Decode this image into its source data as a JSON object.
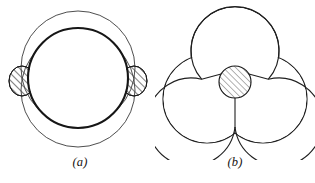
{
  "figure": {
    "background_color": "#ffffff",
    "stroke_color": "#1a1a1a",
    "thin_stroke_color": "#3a3a3a",
    "hatch_color": "#555555",
    "panels": [
      {
        "id": "a",
        "label": "(a)",
        "description": "Two overlapping spheres with a hatched lens-shaped contact ring",
        "thick_circle": {
          "cx": 78,
          "cy": 78,
          "r": 50,
          "stroke_width": 2.1
        },
        "thin_circle_top": {
          "cx": 78,
          "cy": 68,
          "r": 57,
          "stroke_width": 0.9
        },
        "thin_circle_bottom": {
          "cx": 78,
          "cy": 90,
          "r": 57,
          "stroke_width": 0.9
        },
        "hatched_ellipse_left": {
          "cx": 22,
          "cy": 81,
          "rx": 13,
          "ry": 15
        },
        "hatched_ellipse_right": {
          "cx": 134,
          "cy": 81,
          "rx": 13,
          "ry": 15
        }
      },
      {
        "id": "b",
        "label": "(b)",
        "description": "Three spheres meeting at a hatched central circle with three radial partitions",
        "lobe_radius": 44,
        "lobes": [
          {
            "name": "top-lobe",
            "cx": 80,
            "cy": 51
          },
          {
            "name": "bottom-left-lobe",
            "cx": 52,
            "cy": 99
          },
          {
            "name": "bottom-right-lobe",
            "cx": 108,
            "cy": 99
          }
        ],
        "center_circle": {
          "cx": 80,
          "cy": 82,
          "r": 16
        },
        "radial_lines": [
          {
            "name": "upper-left-partition",
            "angle_deg": 210
          },
          {
            "name": "upper-right-partition",
            "angle_deg": 330
          },
          {
            "name": "lower-partition",
            "angle_deg": 90
          }
        ]
      }
    ]
  }
}
